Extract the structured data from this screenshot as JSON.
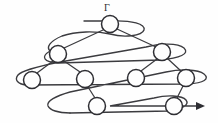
{
  "figure": {
    "kind": "graph-diagram",
    "title_label": "Γ",
    "label_position": {
      "x": 104,
      "y": 3
    },
    "canvas": {
      "width": 218,
      "height": 123
    },
    "colors": {
      "background": "#fefefe",
      "stroke": "#3b3b3f",
      "node_stroke": "#2e2e33",
      "node_fill": "#fefefe",
      "arrow": "#2e2e33"
    },
    "nodes": [
      {
        "id": "root",
        "label": "",
        "cx": 110,
        "cy": 24,
        "r": 8.5,
        "level": 0
      },
      {
        "id": "l1-left",
        "label": "",
        "cx": 58,
        "cy": 54,
        "r": 8.5,
        "level": 1
      },
      {
        "id": "l1-right",
        "label": "",
        "cx": 162,
        "cy": 52,
        "r": 8.5,
        "level": 1
      },
      {
        "id": "l2-a",
        "label": "",
        "cx": 32,
        "cy": 80,
        "r": 8.5,
        "level": 2
      },
      {
        "id": "l2-b",
        "label": "",
        "cx": 85,
        "cy": 79,
        "r": 8.5,
        "level": 2
      },
      {
        "id": "l2-c",
        "label": "",
        "cx": 136,
        "cy": 78,
        "r": 8.5,
        "level": 2
      },
      {
        "id": "l2-d",
        "label": "",
        "cx": 186,
        "cy": 78,
        "r": 8.5,
        "level": 2
      },
      {
        "id": "l3-a",
        "label": "",
        "cx": 97,
        "cy": 106,
        "r": 8.5,
        "level": 3
      },
      {
        "id": "l3-b",
        "label": "",
        "cx": 174,
        "cy": 106,
        "r": 8.5,
        "level": 3
      }
    ],
    "edges": [
      {
        "from": "root",
        "to": "l1-left"
      },
      {
        "from": "root",
        "to": "l1-right"
      },
      {
        "from": "l1-left",
        "to": "l2-a"
      },
      {
        "from": "l1-left",
        "to": "l2-b"
      },
      {
        "from": "l1-right",
        "to": "l2-c"
      },
      {
        "from": "l1-right",
        "to": "l2-d"
      },
      {
        "from": "l2-b",
        "to": "l3-a"
      },
      {
        "from": "l2-d",
        "to": "l3-b"
      }
    ],
    "threads": [
      {
        "id": "thread-level-0",
        "note": "loop around root node"
      },
      {
        "id": "thread-level-1",
        "note": "sweep across level-1 nodes"
      },
      {
        "id": "thread-level-2",
        "note": "sweep across level-2 nodes"
      },
      {
        "id": "thread-level-3",
        "note": "sweep across level-3 nodes ending in arrow"
      }
    ],
    "arrow": {
      "x": 198,
      "y": 106,
      "direction": "right"
    },
    "stub": {
      "x1": 84,
      "y1": 21,
      "x2": 102,
      "y2": 21
    }
  }
}
